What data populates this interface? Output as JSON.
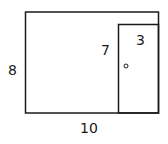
{
  "diagram": {
    "type": "wall-with-door",
    "wall": {
      "width_label": "10",
      "height_label": "8"
    },
    "door": {
      "width_label": "3",
      "height_label": "7",
      "knob": "door-knob"
    },
    "colors": {
      "stroke": "#1a1a1a",
      "background": "#ffffff"
    }
  }
}
